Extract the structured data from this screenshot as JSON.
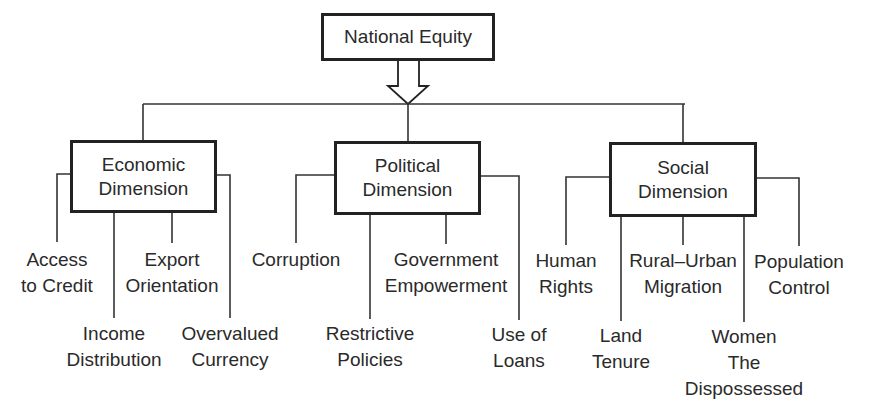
{
  "root": {
    "label": "National Equity"
  },
  "dimensions": [
    {
      "label_line1": "Economic",
      "label_line2": "Dimension",
      "factors": [
        {
          "lines": [
            "Access",
            "to Credit"
          ]
        },
        {
          "lines": [
            "Income",
            "Distribution"
          ]
        },
        {
          "lines": [
            "Export",
            "Orientation"
          ]
        },
        {
          "lines": [
            "Overvalued",
            "Currency"
          ]
        }
      ]
    },
    {
      "label_line1": "Political",
      "label_line2": "Dimension",
      "factors": [
        {
          "lines": [
            "Corruption"
          ]
        },
        {
          "lines": [
            "Restrictive",
            "Policies"
          ]
        },
        {
          "lines": [
            "Government",
            "Empowerment"
          ]
        },
        {
          "lines": [
            "Use of",
            "Loans"
          ]
        }
      ]
    },
    {
      "label_line1": "Social",
      "label_line2": "Dimension",
      "factors": [
        {
          "lines": [
            "Human",
            "Rights"
          ]
        },
        {
          "lines": [
            "Land",
            "Tenure"
          ]
        },
        {
          "lines": [
            "Rural–Urban",
            "Migration"
          ]
        },
        {
          "lines": [
            "Women",
            "The",
            "Dispossessed"
          ]
        },
        {
          "lines": [
            "Population",
            "Control"
          ]
        }
      ]
    }
  ],
  "colors": {
    "line": "#333333",
    "box_border": "#222222",
    "text": "#2a2a2a",
    "background": "#ffffff"
  }
}
